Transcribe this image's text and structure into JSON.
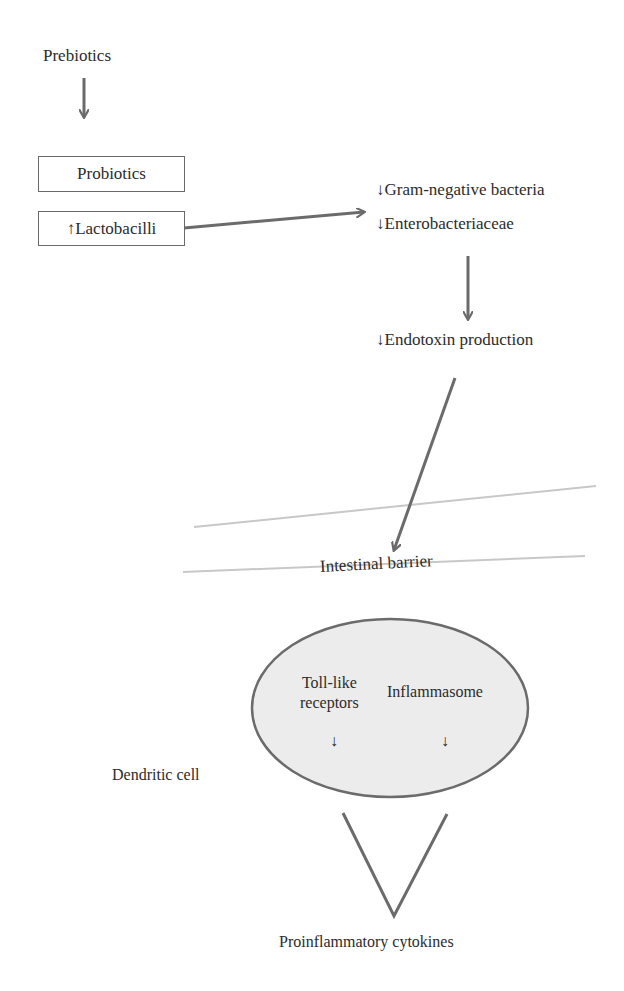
{
  "diagram": {
    "nodes": {
      "prebiotics": "Prebiotics",
      "probiotics": "Probiotics",
      "lactobacilli": "↑Lactobacilli",
      "gram_negative": "↓Gram-negative bacteria",
      "enterobacteriaceae": "↓Enterobacteriaceae",
      "endotoxin": "↓Endotoxin production",
      "intestinal_barrier": "Intestinal barrier",
      "dendritic_cell": "Dendritic cell",
      "toll_like_line1": "Toll-like",
      "toll_like_line2": "receptors",
      "inflammasome": "Inflammasome",
      "toll_like_effect": "↓",
      "inflammasome_effect": "↓",
      "cytokines": "Proinflammatory cytokines"
    },
    "edges": [
      {
        "from": "Prebiotics",
        "to": "Probiotics"
      },
      {
        "from": "↑Lactobacilli",
        "to": "↓Gram-negative bacteria / ↓Enterobacteriaceae"
      },
      {
        "from": "↓Enterobacteriaceae",
        "to": "↓Endotoxin production"
      },
      {
        "from": "↓Endotoxin production",
        "to": "Intestinal barrier"
      },
      {
        "from": "Dendritic cell (Toll-like receptors, Inflammasome)",
        "to": "Proinflammatory cytokines"
      }
    ],
    "colors": {
      "arrow": "#6b6b6b",
      "barrier_line": "#c8c8c8",
      "cell_fill": "#ececec",
      "cell_stroke": "#6b6b6b",
      "text": "#2b2b2b"
    }
  }
}
